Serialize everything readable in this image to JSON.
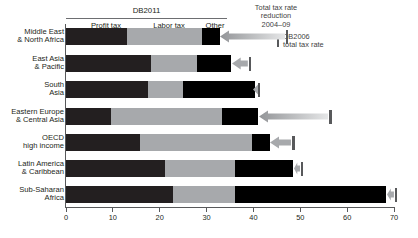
{
  "header": {
    "group_label": "DB2011",
    "segment_labels": [
      "Profit tax",
      "Labor tax",
      "Other"
    ],
    "annotation_reduction": "Total tax rate\nreduction\n2004–09",
    "annotation_db2006": "DB2006\ntotal tax rate"
  },
  "axis": {
    "ticks": [
      "0",
      "10",
      "20",
      "30",
      "40",
      "50",
      "60",
      "70"
    ],
    "min": 0,
    "max": 70
  },
  "colors": {
    "profit_tax": "#231f20",
    "labor_tax": "#a7a9ac",
    "other": "#000000",
    "marker": "#58595b",
    "arrow": "#bcbec0",
    "axis": "#58595b"
  },
  "chart_data": {
    "type": "bar",
    "title": "DB2011",
    "xlabel": "",
    "ylabel": "",
    "xlim": [
      0,
      70
    ],
    "grid": false,
    "legend_position": "top",
    "orientation": "horizontal",
    "stacked": true,
    "categories": [
      "Middle East & North Africa",
      "East Asia & Pacific",
      "South Asia",
      "Eastern Europe & Central Asia",
      "OECD high income",
      "Latin America & Caribbean",
      "Sub-Saharan Africa"
    ],
    "series": [
      {
        "name": "Profit tax",
        "values": [
          13.0,
          18.1,
          17.6,
          9.5,
          15.8,
          21.1,
          22.9
        ]
      },
      {
        "name": "Labor tax",
        "values": [
          16.0,
          9.8,
          7.3,
          23.7,
          24.0,
          14.9,
          13.1
        ]
      },
      {
        "name": "Other",
        "values": [
          3.8,
          7.4,
          15.4,
          7.8,
          3.7,
          12.5,
          32.4
        ]
      }
    ],
    "totals_db2011": [
      32.8,
      35.3,
      40.3,
      41.0,
      43.5,
      48.5,
      68.4
    ],
    "totals_db2006": [
      47.0,
      39.0,
      41.0,
      56.2,
      48.3,
      50.1,
      70.2
    ]
  },
  "rows": [
    {
      "label_line1": "Middle East",
      "label_line2": "& North Africa"
    },
    {
      "label_line1": "East Asia",
      "label_line2": "& Pacific"
    },
    {
      "label_line1": "South",
      "label_line2": "Asia"
    },
    {
      "label_line1": "Eastern Europe",
      "label_line2": "& Central Asia"
    },
    {
      "label_line1": "OECD",
      "label_line2": "high income"
    },
    {
      "label_line1": "Latin America",
      "label_line2": "& Caribbean"
    },
    {
      "label_line1": "Sub-Saharan",
      "label_line2": "Africa"
    }
  ]
}
